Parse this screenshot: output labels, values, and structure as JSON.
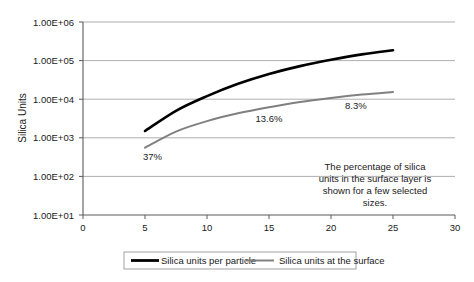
{
  "chart_data": {
    "type": "line",
    "title": "",
    "xlabel": "",
    "ylabel": "Silica Units",
    "xlim": [
      0,
      30
    ],
    "ylim": [
      10,
      1000000
    ],
    "yscale": "log",
    "xticks": [
      "0",
      "5",
      "10",
      "15",
      "20",
      "25",
      "30"
    ],
    "yticks": [
      "1.00E+01",
      "1.00E+02",
      "1.00E+03",
      "1.00E+04",
      "1.00E+05",
      "1.00E+06"
    ],
    "grid": "horizontal",
    "legend_position": "bottom",
    "series": [
      {
        "name": "Silica units per particle",
        "color": "#000000",
        "x": [
          5,
          7.5,
          10,
          12.5,
          15,
          17.5,
          20,
          22.5,
          25
        ],
        "values": [
          1500,
          5000,
          12000,
          25000,
          45000,
          72000,
          105000,
          145000,
          185000
        ]
      },
      {
        "name": "Silica units at the surface",
        "color": "#808080",
        "x": [
          5,
          7.5,
          10,
          12.5,
          15,
          17.5,
          20,
          22.5,
          25
        ],
        "values": [
          555,
          1450,
          2700,
          4300,
          6200,
          8500,
          10800,
          13200,
          15400
        ]
      }
    ],
    "annotations": [
      {
        "text": "37%",
        "x": 5.6,
        "y": 260
      },
      {
        "text": "13.6%",
        "x": 15.0,
        "y": 2600
      },
      {
        "text": "8.3%",
        "x": 22.0,
        "y": 5600
      }
    ],
    "note": {
      "lines": [
        "The percentage of silica",
        "units in the surface layer is",
        "shown for a few selected",
        "sizes."
      ]
    }
  },
  "legend": {
    "items": [
      {
        "label": "Silica units per particle",
        "color": "#000000"
      },
      {
        "label": "Silica units at the surface",
        "color": "#808080"
      }
    ]
  }
}
